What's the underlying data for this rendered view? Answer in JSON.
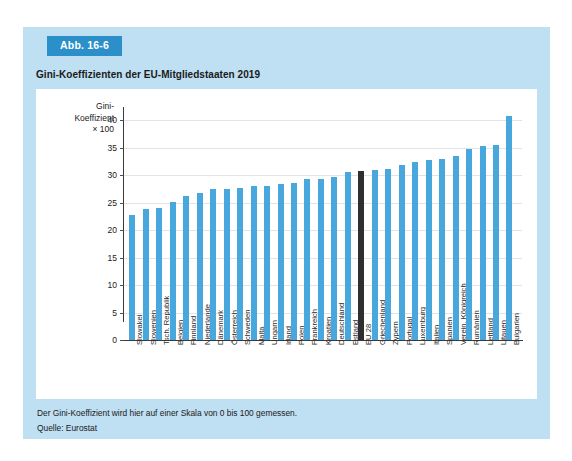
{
  "figure": {
    "badge": "Abb. 16-6",
    "title": "Gini-Koeffizienten der EU-Mitgliedstaaten 2019",
    "note": "Der Gini-Koeffizient wird hier auf einer Skala von 0 bis 100 gemessen.",
    "source": "Quelle: Eurostat"
  },
  "axis_caption": {
    "line1": "Gini-",
    "line2": "Koeffizient",
    "line3": "× 100"
  },
  "colors": {
    "panel_background": "#bfdff2",
    "badge_background": "#2b8fc9",
    "bar": "#48a7dd",
    "bar_highlight": "#2f2f2f",
    "gridline": "#e3e3e3",
    "axis": "#3a3a3a"
  },
  "chart_data": {
    "type": "bar",
    "title": "Gini-Koeffizienten der EU-Mitgliedstaaten 2019",
    "xlabel": "",
    "ylabel": "Gini-Koeffizient × 100",
    "ylim": [
      0,
      42
    ],
    "yticks": [
      0,
      5,
      10,
      15,
      20,
      25,
      30,
      35,
      40
    ],
    "grid": true,
    "legend": null,
    "highlight_category": "EU 28",
    "categories": [
      "Slowakei",
      "Slowenien",
      "Tsch. Republik",
      "Belgien",
      "Finnland",
      "Niederlande",
      "Dänemark",
      "Österreich",
      "Schweden",
      "Malta",
      "Ungarn",
      "Irland",
      "Polen",
      "Frankreich",
      "Kroatien",
      "Deutschland",
      "Estland",
      "EU 28",
      "Griechenland",
      "Zypern",
      "Portugal",
      "Luxemburg",
      "Italien",
      "Spanien",
      "Verein. Königreich",
      "Rumänien",
      "Lettland",
      "Litauen",
      "Bulgarien"
    ],
    "values": [
      22.8,
      23.9,
      24.0,
      25.1,
      26.2,
      26.8,
      27.5,
      27.5,
      27.6,
      28.0,
      28.0,
      28.3,
      28.5,
      29.2,
      29.2,
      29.7,
      30.5,
      30.7,
      31.0,
      31.1,
      31.9,
      32.3,
      32.8,
      33.0,
      33.5,
      34.8,
      35.2,
      35.4,
      40.8
    ]
  }
}
